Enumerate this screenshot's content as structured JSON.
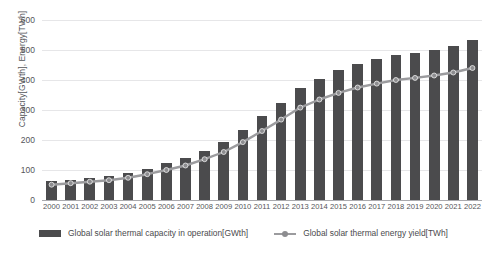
{
  "chart_data": {
    "type": "bar",
    "title": "",
    "subtitle": "",
    "xlabel": "",
    "ylabel": "Capacity[GWth], Energy[TWh]",
    "ylim": [
      0,
      600
    ],
    "ytick_step": 100,
    "ytick_labels": [
      "600",
      "500",
      "400",
      "300",
      "200",
      "100",
      "0"
    ],
    "ytick_values": [
      600,
      500,
      400,
      300,
      200,
      100,
      0
    ],
    "grid": true,
    "legend_position": "bottom",
    "categories": [
      "2000",
      "2001",
      "2002",
      "2003",
      "2004",
      "2005",
      "2006",
      "2007",
      "2008",
      "2009",
      "2010",
      "2011",
      "2012",
      "2013",
      "2014",
      "2015",
      "2016",
      "2017",
      "2018",
      "2019",
      "2020",
      "2021",
      "2022"
    ],
    "series": [
      {
        "name": "Global solar thermal capacity in operation[GWth]",
        "type": "bar",
        "color": "#4b4b4d",
        "values": [
          62,
          68,
          73,
          80,
          90,
          105,
          122,
          140,
          165,
          195,
          235,
          280,
          325,
          375,
          405,
          435,
          455,
          470,
          485,
          490,
          500,
          515,
          535
        ]
      },
      {
        "name": "Global solar thermal energy yield[TWh]",
        "type": "line",
        "color": "#9b9b9e",
        "values": [
          51,
          56,
          61,
          66,
          74,
          86,
          100,
          115,
          136,
          160,
          193,
          230,
          268,
          308,
          335,
          357,
          375,
          388,
          400,
          407,
          415,
          425,
          440
        ]
      }
    ]
  },
  "axes": {
    "y_title": "Capacity[GWth], Energy[TWh]"
  },
  "legend": {
    "items": [
      {
        "label": "Global solar thermal capacity in operation[GWth]",
        "marker": "bar-swatch"
      },
      {
        "label": "Global solar thermal energy yield[TWh]",
        "marker": "line-marker"
      }
    ]
  },
  "colors": {
    "bar": "#4b4b4d",
    "line": "#9b9b9e",
    "marker": "#8d8d90",
    "grid": "#e6e6e8",
    "axis": "#a9a9ad",
    "text": "#55565a",
    "background": "#ffffff"
  }
}
